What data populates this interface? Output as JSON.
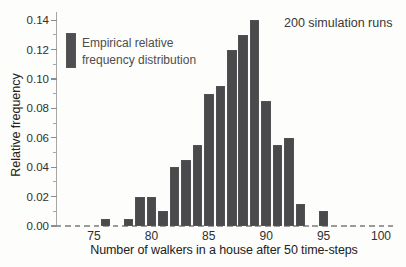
{
  "figure": {
    "background_color": "#fdfdfb",
    "bar_color": "#4a4a4c",
    "axis_color": "#a6a6a6",
    "text_color": "#2f2f2f"
  },
  "chart_data": {
    "type": "bar",
    "title": "",
    "x": [
      76,
      78,
      79,
      80,
      81,
      82,
      83,
      84,
      85,
      86,
      87,
      88,
      89,
      90,
      91,
      92,
      93,
      95
    ],
    "values": [
      0.005,
      0.005,
      0.02,
      0.02,
      0.01,
      0.04,
      0.045,
      0.055,
      0.09,
      0.095,
      0.12,
      0.13,
      0.14,
      0.085,
      0.055,
      0.06,
      0.015,
      0.01
    ],
    "xlabel": "Number of walkers in a house after 50 time-steps",
    "ylabel": "Relative frequency",
    "annotation": "200 simulation runs",
    "legend_lines": [
      "Empirical relative",
      "frequency distribution"
    ],
    "x_ticks": [
      75,
      80,
      85,
      90,
      95,
      100
    ],
    "y_tick_labels": [
      "0.00",
      "0.02",
      "0.04",
      "0.06",
      "0.08",
      "0.10",
      "0.12",
      "0.14"
    ],
    "y_minor_tick_step": 0.01,
    "xlim": [
      71.7,
      101.3
    ],
    "ylim": [
      0,
      0.14
    ],
    "grid": false,
    "baseline_style": "dashed",
    "legend_position": "upper-left",
    "annotation_position": "upper-right"
  }
}
